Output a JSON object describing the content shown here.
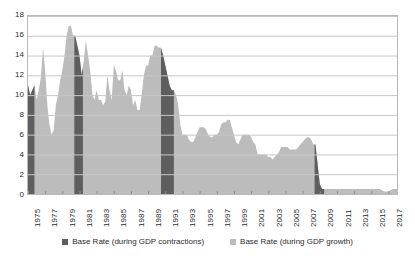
{
  "chart_data": {
    "type": "area",
    "title": "",
    "subtitle": "",
    "xlabel": "",
    "ylabel": "",
    "ylim": [
      0,
      18
    ],
    "xlim": [
      1975,
      2018
    ],
    "grid": true,
    "legend_position": "bottom",
    "y_ticks": [
      18,
      16,
      14,
      12,
      10,
      8,
      6,
      4,
      2,
      0
    ],
    "x_ticks": [
      "1975",
      "1977",
      "1979",
      "1981",
      "1983",
      "1985",
      "1987",
      "1989",
      "1991",
      "1993",
      "1995",
      "1997",
      "1999",
      "2001",
      "2003",
      "2005",
      "2007",
      "2009",
      "2011",
      "2013",
      "2015",
      "2017"
    ],
    "colors": {
      "contraction": "#5e5e5e",
      "growth": "#bcbcbc",
      "grid": "#c6c6c6",
      "frame": "#b9b9b9",
      "text": "#2b2b2b"
    },
    "series": [
      {
        "name": "Base Rate (during GDP contractions)",
        "key": "contraction",
        "color": "#5e5e5e"
      },
      {
        "name": "Base Rate (during GDP growth)",
        "key": "growth",
        "color": "#bcbcbc"
      }
    ],
    "contraction_periods": [
      {
        "start": 1975.0,
        "end": 1975.75
      },
      {
        "start": 1980.4,
        "end": 1981.4
      },
      {
        "start": 1990.5,
        "end": 1992.0
      },
      {
        "start": 2008.4,
        "end": 2009.5
      }
    ],
    "x": [
      1975.0,
      1975.25,
      1975.5,
      1975.75,
      1976.0,
      1976.25,
      1976.5,
      1976.75,
      1977.0,
      1977.25,
      1977.5,
      1977.75,
      1978.0,
      1978.25,
      1978.5,
      1978.75,
      1979.0,
      1979.25,
      1979.5,
      1979.75,
      1980.0,
      1980.25,
      1980.5,
      1980.75,
      1981.0,
      1981.25,
      1981.5,
      1981.75,
      1982.0,
      1982.25,
      1982.5,
      1982.75,
      1983.0,
      1983.25,
      1983.5,
      1983.75,
      1984.0,
      1984.25,
      1984.5,
      1984.75,
      1985.0,
      1985.25,
      1985.5,
      1985.75,
      1986.0,
      1986.25,
      1986.5,
      1986.75,
      1987.0,
      1987.25,
      1987.5,
      1987.75,
      1988.0,
      1988.25,
      1988.5,
      1988.75,
      1989.0,
      1989.25,
      1989.5,
      1989.75,
      1990.0,
      1990.25,
      1990.5,
      1990.75,
      1991.0,
      1991.25,
      1991.5,
      1991.75,
      1992.0,
      1992.25,
      1992.5,
      1992.75,
      1993.0,
      1993.25,
      1993.5,
      1993.75,
      1994.0,
      1994.25,
      1994.5,
      1994.75,
      1995.0,
      1995.25,
      1995.5,
      1995.75,
      1996.0,
      1996.25,
      1996.5,
      1996.75,
      1997.0,
      1997.25,
      1997.5,
      1997.75,
      1998.0,
      1998.25,
      1998.5,
      1998.75,
      1999.0,
      1999.25,
      1999.5,
      1999.75,
      2000.0,
      2000.25,
      2000.5,
      2000.75,
      2001.0,
      2001.25,
      2001.5,
      2001.75,
      2002.0,
      2002.25,
      2002.5,
      2002.75,
      2003.0,
      2003.25,
      2003.5,
      2003.75,
      2004.0,
      2004.25,
      2004.5,
      2004.75,
      2005.0,
      2005.25,
      2005.5,
      2005.75,
      2006.0,
      2006.25,
      2006.5,
      2006.75,
      2007.0,
      2007.25,
      2007.5,
      2007.75,
      2008.0,
      2008.25,
      2008.5,
      2008.75,
      2009.0,
      2009.25,
      2009.5,
      2009.75,
      2010.0,
      2010.5,
      2011.0,
      2011.5,
      2012.0,
      2012.5,
      2013.0,
      2013.5,
      2014.0,
      2014.5,
      2015.0,
      2015.5,
      2016.0,
      2016.5,
      2017.0,
      2017.5,
      2018.0
    ],
    "values": [
      11.0,
      10.0,
      10.5,
      11.0,
      9.5,
      10.5,
      11.8,
      14.8,
      12.5,
      9.0,
      7.0,
      6.0,
      6.5,
      9.0,
      10.0,
      11.5,
      12.5,
      14.0,
      16.0,
      17.0,
      17.0,
      16.0,
      16.0,
      15.0,
      14.0,
      12.0,
      13.5,
      15.5,
      14.0,
      12.5,
      10.0,
      9.5,
      10.5,
      9.5,
      9.5,
      9.0,
      9.3,
      12.0,
      10.5,
      9.5,
      13.0,
      12.5,
      11.5,
      11.5,
      12.5,
      10.5,
      10.0,
      11.0,
      10.5,
      9.0,
      9.5,
      8.5,
      8.5,
      10.0,
      12.0,
      13.0,
      13.0,
      14.0,
      14.0,
      15.0,
      15.0,
      14.8,
      14.8,
      14.0,
      13.0,
      12.0,
      11.0,
      10.5,
      10.5,
      10.0,
      9.0,
      7.0,
      6.0,
      6.0,
      6.0,
      5.5,
      5.25,
      5.25,
      5.75,
      6.25,
      6.75,
      6.75,
      6.75,
      6.5,
      6.0,
      5.75,
      5.75,
      6.0,
      6.0,
      6.25,
      7.0,
      7.25,
      7.25,
      7.5,
      7.5,
      6.75,
      6.0,
      5.25,
      5.0,
      5.5,
      6.0,
      6.0,
      6.0,
      6.0,
      5.75,
      5.25,
      5.0,
      4.0,
      4.0,
      4.0,
      4.0,
      4.0,
      3.75,
      3.75,
      3.5,
      3.75,
      4.0,
      4.25,
      4.75,
      4.75,
      4.75,
      4.75,
      4.5,
      4.5,
      4.5,
      4.5,
      4.75,
      5.0,
      5.25,
      5.5,
      5.75,
      5.75,
      5.5,
      5.0,
      5.0,
      3.0,
      1.0,
      0.5,
      0.5,
      0.5,
      0.5,
      0.5,
      0.5,
      0.5,
      0.5,
      0.5,
      0.5,
      0.5,
      0.5,
      0.5,
      0.5,
      0.5,
      0.5,
      0.25,
      0.25,
      0.5,
      0.5
    ]
  },
  "legend": {
    "entries": [
      {
        "label": "Base Rate (during GDP contractions)",
        "color": "#5e5e5e"
      },
      {
        "label": "Base Rate (during GDP growth)",
        "color": "#bcbcbc"
      }
    ]
  }
}
